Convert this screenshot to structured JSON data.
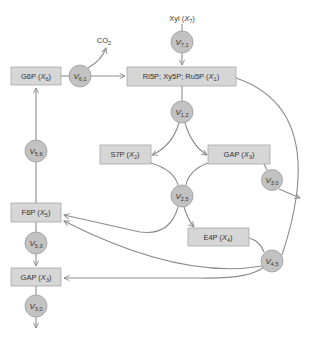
{
  "diagram": {
    "type": "metabolic-pathway",
    "colors": {
      "box_fill": "#d6d6d6",
      "node_fill": "#c2c2c2",
      "edge": "#8c8c8c",
      "text": "#333333"
    },
    "metabolites": {
      "g6p": {
        "name": "G6P (",
        "var": "X",
        "sub": "6",
        "close": ")"
      },
      "ri5p": {
        "name": "Ri5P; Xy5P; Ru5P (",
        "var": "X",
        "sub": "1",
        "close": ")"
      },
      "s7p": {
        "name": "S7P (",
        "var": "X",
        "sub": "2",
        "close": ")"
      },
      "gap_r": {
        "name": "GAP (",
        "var": "X",
        "sub": "3",
        "close": ")"
      },
      "f6p": {
        "name": "F6P (",
        "var": "X",
        "sub": "5",
        "close": ")"
      },
      "e4p": {
        "name": "E4P (",
        "var": "X",
        "sub": "4",
        "close": ")"
      },
      "gap_l": {
        "name": "GAP (",
        "var": "X",
        "sub": "3",
        "close": ")"
      },
      "xyl": {
        "name": "Xyl (",
        "var": "X",
        "sub": "7",
        "close": ")"
      },
      "co2": {
        "name": "CO",
        "sub": "2"
      }
    },
    "reactions": {
      "v61": {
        "var": "V",
        "sub": "6,1"
      },
      "v71": {
        "var": "V",
        "sub": "7,1"
      },
      "v12": {
        "var": "V",
        "sub": "1,2"
      },
      "v30r": {
        "var": "V",
        "sub": "3,0"
      },
      "v25": {
        "var": "V",
        "sub": "2,5"
      },
      "v56": {
        "var": "V",
        "sub": "5,6"
      },
      "v53": {
        "var": "V",
        "sub": "5,3"
      },
      "v45": {
        "var": "V",
        "sub": "4,5"
      },
      "v30l": {
        "var": "V",
        "sub": "3,0"
      }
    }
  }
}
